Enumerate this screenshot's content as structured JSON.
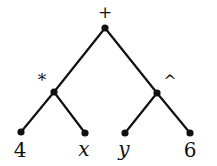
{
  "tree": {
    "nodes": [
      {
        "id": "root",
        "label": "+",
        "x": 105,
        "y": 28,
        "lx": 105,
        "ly": 18,
        "italic": false,
        "size": 17
      },
      {
        "id": "mul",
        "label": "*",
        "x": 54,
        "y": 92,
        "lx": 42,
        "ly": 86,
        "italic": false,
        "size": 17
      },
      {
        "id": "pow",
        "label": "^",
        "x": 157,
        "y": 93,
        "lx": 170,
        "ly": 87,
        "italic": false,
        "size": 16
      },
      {
        "id": "four",
        "label": "4",
        "x": 21,
        "y": 132,
        "lx": 20,
        "ly": 157,
        "italic": false,
        "size": 20
      },
      {
        "id": "x",
        "label": "x",
        "x": 85,
        "y": 133,
        "lx": 84,
        "ly": 156,
        "italic": true,
        "size": 20
      },
      {
        "id": "y",
        "label": "y",
        "x": 125,
        "y": 133,
        "lx": 124,
        "ly": 156,
        "italic": true,
        "size": 20
      },
      {
        "id": "six",
        "label": "6",
        "x": 190,
        "y": 133,
        "lx": 190,
        "ly": 157,
        "italic": false,
        "size": 20
      }
    ],
    "edges": [
      [
        "root",
        "mul"
      ],
      [
        "root",
        "pow"
      ],
      [
        "mul",
        "four"
      ],
      [
        "mul",
        "x"
      ],
      [
        "pow",
        "y"
      ],
      [
        "pow",
        "six"
      ]
    ],
    "color": "#111111"
  }
}
